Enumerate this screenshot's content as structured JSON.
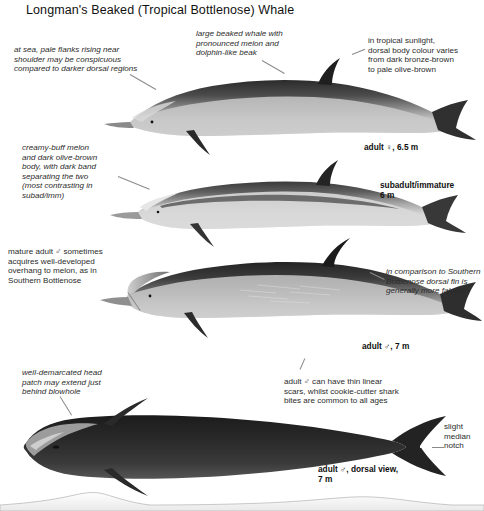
{
  "plate": {
    "title": "Longman's Beaked (Tropical Bottlenose) Whale",
    "background_color": "#ffffff",
    "ink_color": "#1a1a1a",
    "leader_color": "#8a8a8a"
  },
  "annotations": {
    "at_sea_flanks": "at sea, pale flanks rising near\nshoulder may be conspicuous\ncompared to darker dorsal regions",
    "large_beaked": "large beaked whale with\npronounced melon and\ndolphin-like beak",
    "tropical_sunlight": "in tropical sunlight,\ndorsal body colour varies\nfrom dark bronze-brown\nto pale olive-brown",
    "creamy_buff_melon": "creamy-buff melon\nand dark olive-brown\nbody, with dark band\nseparating the two\n(most contrasting in\nsubad/imm)",
    "mature_male_overhang": "mature adult ♂ sometimes\nacquires well-developed\noverhang to melon, as in\nSouthern Bottlenose",
    "dorsal_fin_falcate": "in comparison to Southern\nBottlenose dorsal fin is\ngenerally more falcate",
    "head_patch": "well-demarcated head\npatch may extend just\nbehind blowhole",
    "linear_scars": "adult ♂ can have thin linear\nscars, whilst cookie-cutter shark\nbites are common to all ages",
    "median_notch": "slight\nmedian\nnotch"
  },
  "specimen_labels": {
    "adult_female": "adult ♀, 6.5 m",
    "subadult": "subadult/immature\n6 m",
    "adult_male": "adult ♂, 7 m",
    "adult_male_dorsal": "adult ♂, dorsal view,\n7 m"
  },
  "figures": [
    {
      "name": "adult-female-lateral",
      "label": "adult ♀, 6.5 m"
    },
    {
      "name": "subadult-immature-lateral",
      "label": "subadult/immature 6 m"
    },
    {
      "name": "adult-male-lateral",
      "label": "adult ♂, 7 m"
    },
    {
      "name": "adult-male-dorsal",
      "label": "adult ♂, dorsal view, 7 m"
    }
  ]
}
